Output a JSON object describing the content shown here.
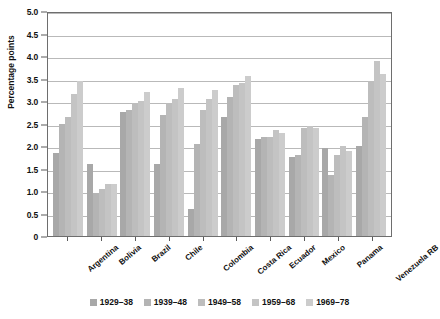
{
  "chart_data": {
    "type": "bar",
    "title": "",
    "subtitle": "",
    "xlabel": "",
    "ylabel": "Percentage points",
    "ylim": [
      0,
      5.0
    ],
    "yticks": [
      "0",
      "0.5",
      "1.0",
      "1.5",
      "2.0",
      "2.5",
      "3.0",
      "3.5",
      "4.0",
      "4.5",
      "5.0"
    ],
    "ytick_values": [
      0,
      0.5,
      1.0,
      1.5,
      2.0,
      2.5,
      3.0,
      3.5,
      4.0,
      4.5,
      5.0
    ],
    "grid": true,
    "legend_position": "bottom",
    "categories": [
      "Argentina",
      "Bolivia",
      "Brazil",
      "Chile",
      "Colombia",
      "Costa Rica",
      "Ecuador",
      "Mexico",
      "Panama",
      "Venezuela RB"
    ],
    "series": [
      {
        "name": "1929–38",
        "color": "#a8a8a8",
        "values": [
          1.85,
          1.6,
          2.75,
          1.6,
          0.6,
          2.65,
          2.15,
          1.75,
          1.95,
          2.0
        ]
      },
      {
        "name": "1939–48",
        "color": "#b4b4b4",
        "values": [
          2.5,
          0.95,
          2.8,
          2.7,
          2.05,
          3.1,
          2.2,
          1.8,
          1.35,
          2.65
        ]
      },
      {
        "name": "1949–58",
        "color": "#bdbdbd",
        "values": [
          2.65,
          1.05,
          2.95,
          2.95,
          2.8,
          3.35,
          2.2,
          2.4,
          1.8,
          3.45
        ]
      },
      {
        "name": "1959–68",
        "color": "#c4c4c4",
        "values": [
          3.15,
          1.15,
          3.0,
          3.05,
          3.05,
          3.4,
          2.35,
          2.45,
          2.0,
          3.9
        ]
      },
      {
        "name": "1969–78",
        "color": "#cccccc",
        "values": [
          3.45,
          1.15,
          3.2,
          3.3,
          3.25,
          3.55,
          2.3,
          2.4,
          1.9,
          3.6
        ]
      }
    ]
  },
  "colors": {
    "axis": "#6e6e6e",
    "grid": "#b9b9b9",
    "text": "#111111",
    "background": "#ffffff"
  }
}
